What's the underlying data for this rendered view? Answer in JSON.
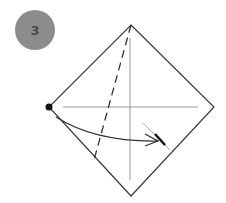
{
  "step": {
    "number": "3"
  },
  "colors": {
    "badge": "#8c8c8c",
    "badge_text": "#4a4a4a",
    "outline": "#3a3a3a",
    "crease": "#999999",
    "arrow": "#333333",
    "dot": "#111111"
  },
  "diagram": {
    "shape": "square-diamond",
    "vertices": {
      "top": [
        131,
        25
      ],
      "left": [
        49,
        107
      ],
      "right": [
        214,
        107
      ],
      "bottom": [
        131,
        196
      ]
    },
    "elements": [
      "valley-fold-dashed-line",
      "horizontal-crease",
      "vertical-crease",
      "reference-dot-left-corner",
      "curved-fold-arrow",
      "landing-mark"
    ]
  }
}
